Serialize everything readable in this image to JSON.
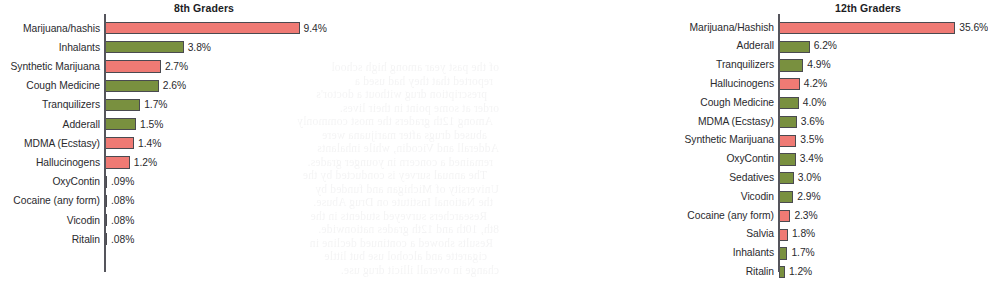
{
  "page": {
    "background_color": "#ffffff",
    "bar_colors": {
      "red": "#ef7a74",
      "green": "#79903f"
    },
    "axis_color": "#55555c",
    "text_color": "#2a2a2e"
  },
  "bleed_through_lines": [
    "of the past year among high school",
    "reported that they had used a",
    "prescription drug without a doctor's",
    "order at some point in their lives.",
    "Among 12th graders the most commonly",
    "abused drugs after marijuana were",
    "Adderall and Vicodin, while inhalants",
    "remained a concern in younger grades.",
    "The annual survey is conducted by the",
    "University of Michigan and funded by",
    "the National Institute on Drug Abuse.",
    "Researchers surveyed students in the",
    "8th, 10th and 12th grades nationwide.",
    "Results showed a continued decline in",
    "cigarette and alcohol use but little",
    "change in overall illicit drug use."
  ],
  "chart_data": [
    {
      "type": "bar",
      "orientation": "horizontal",
      "title": "8th Graders",
      "xlabel": "",
      "ylabel": "",
      "grid": false,
      "legend": "none",
      "xlim": [
        0,
        9.4
      ],
      "axis_x_px": 104,
      "px_per_unit": 20.7,
      "categories": [
        "Marijuana/hashis",
        "Inhalants",
        "Synthetic Marijuana",
        "Cough Medicine",
        "Tranquilizers",
        "Adderall",
        "MDMA (Ecstasy)",
        "Hallucinogens",
        "OxyContin",
        "Cocaine (any form)",
        "Vicodin",
        "Ritalin"
      ],
      "values": [
        9.4,
        3.8,
        2.7,
        2.6,
        1.7,
        1.5,
        1.4,
        1.2,
        0.09,
        0.08,
        0.08,
        0.08
      ],
      "value_labels": [
        "9.4%",
        "3.8%",
        "2.7%",
        "2.6%",
        "1.7%",
        "1.5%",
        "1.4%",
        "1.2%",
        ".09%",
        ".08%",
        ".08%",
        ".08%"
      ],
      "colors": [
        "red",
        "green",
        "red",
        "green",
        "green",
        "green",
        "red",
        "red",
        "green",
        "red",
        "green",
        "green"
      ]
    },
    {
      "type": "bar",
      "orientation": "horizontal",
      "title": "12th Graders",
      "xlabel": "",
      "ylabel": "",
      "grid": false,
      "legend": "none",
      "xlim": [
        0,
        35.6
      ],
      "axis_x_px": 444,
      "px_per_unit": 4.95,
      "categories": [
        "Marijuana/Hashish",
        "Adderall",
        "Tranquilizers",
        "Hallucinogens",
        "Cough Medicine",
        "MDMA (Ecstasy)",
        "Synthetic Marijuana",
        "OxyContin",
        "Sedatives",
        "Vicodin",
        "Cocaine (any form)",
        "Salvia",
        "Inhalants",
        "Ritalin"
      ],
      "values": [
        35.6,
        6.2,
        4.9,
        4.2,
        4.0,
        3.6,
        3.5,
        3.4,
        3.0,
        2.9,
        2.3,
        1.8,
        1.7,
        1.2
      ],
      "value_labels": [
        "35.6%",
        "6.2%",
        "4.9%",
        "4.2%",
        "4.0%",
        "3.6%",
        "3.5%",
        "3.4%",
        "3.0%",
        "2.9%",
        "2.3%",
        "1.8%",
        "1.7%",
        "1.2%"
      ],
      "colors": [
        "red",
        "green",
        "green",
        "red",
        "green",
        "green",
        "red",
        "green",
        "green",
        "green",
        "red",
        "red",
        "green",
        "green"
      ]
    }
  ]
}
